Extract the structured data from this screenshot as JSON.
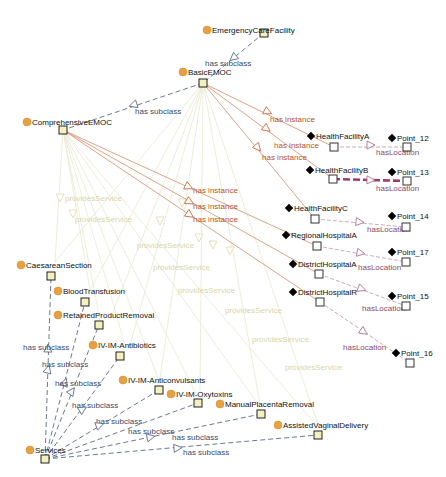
{
  "colors": {
    "class_circle": "#e8a040",
    "class_box_fill": "#f5f0c0",
    "instance_diamond": "#000000",
    "instance_box_fill": "#ffffff",
    "subclass_edge": "#5a6a8a",
    "instance_edge": "#d89878",
    "location_edge": "#c8a0b0",
    "location_edge_highlight": "#a03a6a",
    "service_edge": "#e8e8d0",
    "subclass_label": "#3a4a6a",
    "instance_label": "#b5542a",
    "location_label": "#8a4a6a",
    "service_label": "#d8d6a8"
  },
  "nodes": {
    "EmergencyCareFacility": {
      "label": "EmergencyCareFacility",
      "kind": "class",
      "cx": 207,
      "cy": 30,
      "bx": 264,
      "by": 33
    },
    "BasicEMOC": {
      "label": "BasicEMOC",
      "kind": "class",
      "cx": 183,
      "cy": 72,
      "bx": 203,
      "by": 83
    },
    "ComprehensiveEMOC": {
      "label": "ComprehensiveEMOC",
      "kind": "class",
      "cx": 27,
      "cy": 122,
      "bx": 63,
      "by": 130
    },
    "HealthFacilityA": {
      "label": "HealthFacilityA",
      "kind": "instance",
      "cx": 311,
      "cy": 136,
      "bx": 334,
      "by": 147
    },
    "HealthFacilityB": {
      "label": "HealthFacilityB",
      "kind": "instance",
      "cx": 310,
      "cy": 170,
      "bx": 333,
      "by": 179
    },
    "HealthFacilityC": {
      "label": "HealthFacilityC",
      "kind": "instance",
      "cx": 289,
      "cy": 208,
      "bx": 315,
      "by": 219
    },
    "RegionalHospitalA": {
      "label": "RegionalHospitalA",
      "kind": "instance",
      "cx": 286,
      "cy": 235,
      "bx": 317,
      "by": 246
    },
    "DistrictHospitalA": {
      "label": "DistrictHospitalA",
      "kind": "instance",
      "cx": 293,
      "cy": 264,
      "bx": 319,
      "by": 274
    },
    "DistrictHospitalB": {
      "label": "DistrictHospitalR",
      "kind": "instance",
      "cx": 293,
      "cy": 292,
      "bx": 320,
      "by": 302
    },
    "Point_12": {
      "label": "Point_12",
      "kind": "instance",
      "cx": 392,
      "cy": 138,
      "bx": 407,
      "by": 147
    },
    "Point_13": {
      "label": "Point_13",
      "kind": "instance",
      "cx": 392,
      "cy": 172,
      "bx": 407,
      "by": 181
    },
    "Point_14": {
      "label": "Point_14",
      "kind": "instance",
      "cx": 392,
      "cy": 216,
      "bx": 406,
      "by": 227
    },
    "Point_17": {
      "label": "Point_17",
      "kind": "instance",
      "cx": 392,
      "cy": 252,
      "bx": 406,
      "by": 262
    },
    "Point_15": {
      "label": "Point_15",
      "kind": "instance",
      "cx": 392,
      "cy": 296,
      "bx": 406,
      "by": 306
    },
    "Point_16": {
      "label": "Point_16",
      "kind": "instance",
      "cx": 396,
      "cy": 353,
      "bx": 410,
      "by": 363
    },
    "CaesareanSection": {
      "label": "CaesareanSection",
      "kind": "class",
      "cx": 21,
      "cy": 265,
      "bx": 51,
      "by": 276
    },
    "BloodTransfusion": {
      "label": "BloodTransfusion",
      "kind": "class",
      "cx": 58,
      "cy": 291,
      "bx": 85,
      "by": 302
    },
    "RetainedProductRemoval": {
      "label": "RetainedProductRemoval",
      "kind": "class",
      "cx": 58,
      "cy": 315,
      "bx": 99,
      "by": 325
    },
    "IV-IM-Antibiotics": {
      "label": "IV-IM-Antibiotics",
      "kind": "class",
      "cx": 93,
      "cy": 345,
      "bx": 120,
      "by": 356
    },
    "IV-IM-Anticonvulsants": {
      "label": "IV-IM-Anticonvulsants",
      "kind": "class",
      "cx": 123,
      "cy": 380,
      "bx": 159,
      "by": 390
    },
    "IV-IM-Oxytoxins": {
      "label": "IV-IM-Oxytoxins",
      "kind": "class",
      "cx": 171,
      "cy": 394,
      "bx": 198,
      "by": 403
    },
    "ManualPlacentaRemoval": {
      "label": "ManualPlacentaRemoval",
      "kind": "class",
      "cx": 220,
      "cy": 404,
      "bx": 261,
      "by": 414
    },
    "AssistedVaginalDelivery": {
      "label": "AssistedVaginalDelivery",
      "kind": "class",
      "cx": 278,
      "cy": 425,
      "bx": 318,
      "by": 435
    },
    "Services": {
      "label": "Services",
      "kind": "class",
      "cx": 30,
      "cy": 450,
      "bx": 45,
      "by": 459
    }
  },
  "edges": {
    "subclass": [
      {
        "from": "EmergencyCareFacility",
        "to": "BasicEMOC",
        "label": "has subclass",
        "lx": 205,
        "ly": 66,
        "ax": 233,
        "ay": 58
      },
      {
        "from": "BasicEMOC",
        "to": "ComprehensiveEMOC",
        "label": "has subclass",
        "lx": 135,
        "ly": 114,
        "ax": 133,
        "ay": 105
      },
      {
        "from": "Services",
        "to": "CaesareanSection",
        "label": "has subclass",
        "lx": 23,
        "ly": 350,
        "ax": 48,
        "ay": 348
      },
      {
        "from": "Services",
        "to": "BloodTransfusion",
        "label": "has subclass",
        "lx": 42,
        "ly": 367,
        "ax": 48,
        "ay": 369
      },
      {
        "from": "Services",
        "to": "RetainedProductRemoval",
        "label": "has subclass",
        "lx": 55,
        "ly": 386,
        "ax": 65,
        "ay": 382
      },
      {
        "from": "Services",
        "to": "IV-IM-Antibiotics",
        "label": "has subclass",
        "lx": 72,
        "ly": 408,
        "ax": 72,
        "ay": 391
      },
      {
        "from": "Services",
        "to": "IV-IM-Anticonvulsants",
        "label": "has subclass",
        "lx": 96,
        "ly": 424,
        "ax": 83,
        "ay": 409
      },
      {
        "from": "Services",
        "to": "IV-IM-Oxytoxins",
        "label": "has subclass",
        "lx": 128,
        "ly": 434,
        "ax": 100,
        "ay": 425
      },
      {
        "from": "Services",
        "to": "ManualPlacentaRemoval",
        "label": "has subclass",
        "lx": 172,
        "ly": 440,
        "ax": 151,
        "ay": 437
      },
      {
        "from": "Services",
        "to": "AssistedVaginalDelivery",
        "label": "has subclass",
        "lx": 183,
        "ly": 455,
        "ax": 178,
        "ay": 448
      }
    ],
    "instance": [
      {
        "from": "BasicEMOC",
        "to": "HealthFacilityA",
        "label": "has instance",
        "lx": 270,
        "ly": 122,
        "ax": 268,
        "ay": 112
      },
      {
        "from": "BasicEMOC",
        "to": "HealthFacilityB",
        "label": "has instance",
        "lx": 274,
        "ly": 148,
        "ax": 267,
        "ay": 129
      },
      {
        "from": "BasicEMOC",
        "to": "HealthFacilityC",
        "label": "has instance",
        "lx": 262,
        "ly": 160,
        "ax": 258,
        "ay": 148
      },
      {
        "from": "ComprehensiveEMOC",
        "to": "RegionalHospitalA",
        "label": "has instance",
        "lx": 193,
        "ly": 193,
        "ax": 189,
        "ay": 187
      },
      {
        "from": "ComprehensiveEMOC",
        "to": "DistrictHospitalA",
        "label": "has instance",
        "lx": 193,
        "ly": 209,
        "ax": 190,
        "ay": 202
      },
      {
        "from": "ComprehensiveEMOC",
        "to": "DistrictHospitalB",
        "label": "has instance",
        "lx": 193,
        "ly": 222,
        "ax": 190,
        "ay": 215
      }
    ],
    "location": [
      {
        "from": "HealthFacilityA",
        "to": "Point_12",
        "label": "hasLocation",
        "lx": 376,
        "ly": 155,
        "ax": 371,
        "ay": 145,
        "highlight": false
      },
      {
        "from": "HealthFacilityB",
        "to": "Point_13",
        "label": "hasLocation",
        "lx": 376,
        "ly": 191,
        "ax": 371,
        "ay": 180,
        "highlight": true
      },
      {
        "from": "HealthFacilityC",
        "to": "Point_14",
        "label": "hasLocation",
        "lx": 367,
        "ly": 232,
        "ax": 360,
        "ay": 222,
        "highlight": false
      },
      {
        "from": "RegionalHospitalA",
        "to": "Point_17",
        "label": "hasLocation",
        "lx": 358,
        "ly": 270,
        "ax": 361,
        "ay": 253,
        "highlight": false
      },
      {
        "from": "DistrictHospitalA",
        "to": "Point_15",
        "label": "hasLocation",
        "lx": 362,
        "ly": 311,
        "ax": 362,
        "ay": 289,
        "highlight": false
      },
      {
        "from": "DistrictHospitalB",
        "to": "Point_16",
        "label": "hasLocation",
        "lx": 343,
        "ly": 350,
        "ax": 364,
        "ay": 332,
        "highlight": false
      }
    ],
    "service": [
      {
        "label": "providesService",
        "lx": 65,
        "ly": 201,
        "ax": 60,
        "ay": 198
      },
      {
        "label": "providesService",
        "lx": 75,
        "ly": 222,
        "ax": 73,
        "ay": 214
      },
      {
        "label": "providesService",
        "lx": 137,
        "ly": 248,
        "ax": 182,
        "ay": 203
      },
      {
        "label": "providesService",
        "lx": 153,
        "ly": 270,
        "ax": 160,
        "ay": 221
      },
      {
        "label": "providesService",
        "lx": 178,
        "ly": 293,
        "ax": 199,
        "ay": 238
      },
      {
        "label": "providesService",
        "lx": 225,
        "ly": 313,
        "ax": 213,
        "ay": 245
      },
      {
        "label": "providesService",
        "lx": 252,
        "ly": 342,
        "ax": 230,
        "ay": 251
      },
      {
        "label": "providesService",
        "lx": 285,
        "ly": 370,
        "ax": 0,
        "ay": 0
      }
    ]
  }
}
